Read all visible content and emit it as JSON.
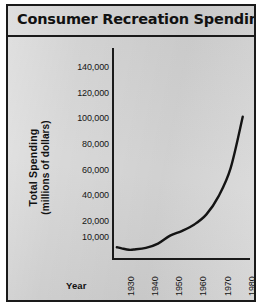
{
  "figure": {
    "title": "Consumer Recreation Spending",
    "background_color": "#d4d4d4",
    "border_color": "#1a1a1a",
    "line_color": "#141414"
  },
  "axes": {
    "y_title_line1": "Total Spending",
    "y_title_line2": "(millions of dollars)",
    "x_title": "Year"
  },
  "chart_data": {
    "type": "line",
    "title": "Consumer Recreation Spending",
    "xlabel": "Year",
    "ylabel": "Total Spending (millions of dollars)",
    "grid": false,
    "legend": null,
    "xlim": [
      1926,
      1983
    ],
    "x_ticks": [
      1930,
      1940,
      1950,
      1960,
      1970,
      1980
    ],
    "x_tick_labels": [
      "1930",
      "1940",
      "1950",
      "1960",
      "1970",
      "1980"
    ],
    "y_ticks": [
      10000,
      20000,
      40000,
      60000,
      80000,
      100000,
      120000,
      140000
    ],
    "y_tick_labels": [
      "10,000",
      "20,000",
      "40,000",
      "60,000",
      "80,000",
      "100,000",
      "120,000",
      "140,000"
    ],
    "y_axis_note": "Non-uniform spacing: the 10,000 and 20,000 ticks are spaced closer together than the even 20,000 increments above them.",
    "series": [
      {
        "name": "Total Spending",
        "x": [
          1928,
          1930,
          1933,
          1935,
          1940,
          1945,
          1950,
          1955,
          1960,
          1965,
          1970,
          1975,
          1980
        ],
        "values": [
          4200,
          3500,
          2600,
          2800,
          3800,
          6500,
          11500,
          14500,
          18500,
          26000,
          40000,
          62000,
          102000
        ]
      }
    ]
  }
}
